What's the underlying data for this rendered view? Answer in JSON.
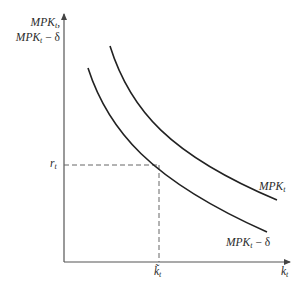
{
  "diagram": {
    "type": "economics-graph",
    "y_axis": {
      "label_line1_main": "MPK",
      "label_line1_sub": "t",
      "label_line1_suffix": ",",
      "label_line2_main": "MPK",
      "label_line2_sub": "t",
      "label_line2_suffix": " − δ"
    },
    "x_axis": {
      "label_main": "k",
      "label_sub": "t"
    },
    "ticks": {
      "y_tick_main": "r",
      "y_tick_sub": "t",
      "x_tick_main": "k̃",
      "x_tick_sub": "t"
    },
    "curves": [
      {
        "name": "MPK",
        "label_main": "MPK",
        "label_sub": "t",
        "label_suffix": ""
      },
      {
        "name": "MPK minus depreciation",
        "label_main": "MPK",
        "label_sub": "t",
        "label_suffix": " − δ"
      }
    ],
    "colors": {
      "axis": "#555555",
      "curve": "#222222",
      "dashed": "#666666"
    }
  }
}
